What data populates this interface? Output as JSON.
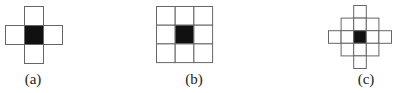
{
  "figures": [
    {
      "id": "a",
      "label": "(a)",
      "pattern": "4-neighborhood (cross)",
      "cell_size": 19,
      "origin": [
        5,
        6
      ],
      "grid": [
        [
          0,
          1,
          0
        ],
        [
          1,
          2,
          1
        ],
        [
          0,
          1,
          0
        ]
      ],
      "label_pos": [
        33,
        80
      ]
    },
    {
      "id": "b",
      "label": "(b)",
      "pattern": "8-neighborhood (3x3 square)",
      "cell_size": 18.7,
      "origin": [
        156,
        6
      ],
      "grid": [
        [
          1,
          1,
          1
        ],
        [
          1,
          2,
          1
        ],
        [
          1,
          1,
          1
        ]
      ],
      "label_pos": [
        194,
        80
      ]
    },
    {
      "id": "c",
      "label": "(c)",
      "pattern": "diamond neighborhood (radius 2)",
      "cell_size": 12.6,
      "origin": [
        328,
        5
      ],
      "grid": [
        [
          0,
          0,
          1,
          0,
          0
        ],
        [
          0,
          1,
          1,
          1,
          0
        ],
        [
          1,
          1,
          2,
          1,
          1
        ],
        [
          0,
          1,
          1,
          1,
          0
        ],
        [
          0,
          0,
          1,
          0,
          0
        ]
      ],
      "label_pos": [
        366,
        80
      ]
    }
  ],
  "colors": {
    "center": "#111111",
    "cell_border": "#666666",
    "cell_fill": "#ffffff"
  }
}
